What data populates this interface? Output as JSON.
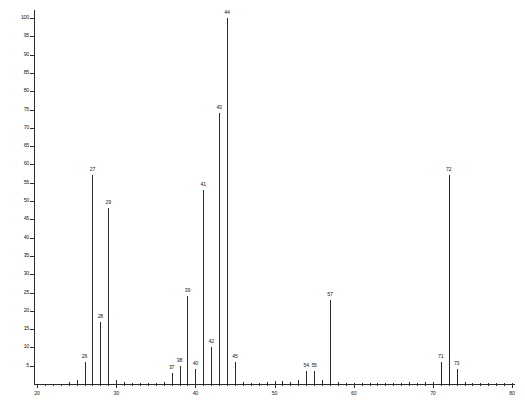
{
  "chart_data": {
    "type": "bar",
    "title": "",
    "subtitle": "",
    "xlabel": "",
    "ylabel": "",
    "xlim": [
      20,
      80
    ],
    "ylim": [
      0,
      100
    ],
    "grid": false,
    "legend": null,
    "x_ticks_major": [
      "20",
      "30",
      "40",
      "50",
      "60",
      "70",
      "80"
    ],
    "x_tick_step_minor": 1,
    "y_ticks": [
      "5",
      "10",
      "15",
      "20",
      "25",
      "30",
      "35",
      "40",
      "45",
      "50",
      "55",
      "60",
      "65",
      "70",
      "75",
      "80",
      "85",
      "90",
      "95",
      "100"
    ],
    "y_tick_step": 5,
    "categories": [
      26,
      27,
      28,
      29,
      37,
      38,
      39,
      40,
      41,
      42,
      43,
      44,
      45,
      54,
      55,
      57,
      71,
      72,
      73
    ],
    "values": [
      6,
      57,
      17,
      48,
      3,
      5,
      24,
      4,
      53,
      10,
      74,
      100,
      6,
      3.5,
      3.5,
      23,
      6,
      57,
      4
    ],
    "labeled_peaks": [
      {
        "mz": 26,
        "intensity": 6,
        "label": "26"
      },
      {
        "mz": 27,
        "intensity": 57,
        "label": "27"
      },
      {
        "mz": 28,
        "intensity": 17,
        "label": "28"
      },
      {
        "mz": 29,
        "intensity": 48,
        "label": "29"
      },
      {
        "mz": 37,
        "intensity": 3,
        "label": "37"
      },
      {
        "mz": 38,
        "intensity": 5,
        "label": "38"
      },
      {
        "mz": 39,
        "intensity": 24,
        "label": "39"
      },
      {
        "mz": 40,
        "intensity": 4,
        "label": "40"
      },
      {
        "mz": 41,
        "intensity": 53,
        "label": "41"
      },
      {
        "mz": 42,
        "intensity": 10,
        "label": "42"
      },
      {
        "mz": 43,
        "intensity": 74,
        "label": "43"
      },
      {
        "mz": 44,
        "intensity": 100,
        "label": "44"
      },
      {
        "mz": 45,
        "intensity": 6,
        "label": "45"
      },
      {
        "mz": 54,
        "intensity": 3.5,
        "label": "54"
      },
      {
        "mz": 55,
        "intensity": 3.5,
        "label": "55"
      },
      {
        "mz": 57,
        "intensity": 23,
        "label": "57"
      },
      {
        "mz": 71,
        "intensity": 6,
        "label": "71"
      },
      {
        "mz": 72,
        "intensity": 57,
        "label": "72"
      },
      {
        "mz": 73,
        "intensity": 4,
        "label": "73"
      }
    ],
    "unlabeled_peaks": [
      {
        "mz": 24,
        "intensity": 0.6
      },
      {
        "mz": 25,
        "intensity": 1.2
      },
      {
        "mz": 30,
        "intensity": 1.0
      },
      {
        "mz": 31,
        "intensity": 0.5
      },
      {
        "mz": 32,
        "intensity": 0.4
      },
      {
        "mz": 33,
        "intensity": 0.4
      },
      {
        "mz": 34,
        "intensity": 0.4
      },
      {
        "mz": 35,
        "intensity": 0.4
      },
      {
        "mz": 36,
        "intensity": 0.5
      },
      {
        "mz": 46,
        "intensity": 0.5
      },
      {
        "mz": 47,
        "intensity": 0.4
      },
      {
        "mz": 48,
        "intensity": 0.4
      },
      {
        "mz": 49,
        "intensity": 0.5
      },
      {
        "mz": 50,
        "intensity": 0.9
      },
      {
        "mz": 51,
        "intensity": 0.9
      },
      {
        "mz": 52,
        "intensity": 0.6
      },
      {
        "mz": 53,
        "intensity": 1.0
      },
      {
        "mz": 56,
        "intensity": 1.0
      },
      {
        "mz": 58,
        "intensity": 0.5
      },
      {
        "mz": 59,
        "intensity": 0.4
      },
      {
        "mz": 60,
        "intensity": 0.4
      },
      {
        "mz": 61,
        "intensity": 0.4
      },
      {
        "mz": 62,
        "intensity": 0.4
      },
      {
        "mz": 63,
        "intensity": 0.4
      },
      {
        "mz": 64,
        "intensity": 0.4
      },
      {
        "mz": 65,
        "intensity": 0.4
      },
      {
        "mz": 66,
        "intensity": 0.4
      },
      {
        "mz": 67,
        "intensity": 0.5
      },
      {
        "mz": 68,
        "intensity": 0.4
      },
      {
        "mz": 69,
        "intensity": 0.5
      },
      {
        "mz": 70,
        "intensity": 0.6
      },
      {
        "mz": 74,
        "intensity": 0.5
      },
      {
        "mz": 75,
        "intensity": 0.4
      },
      {
        "mz": 76,
        "intensity": 0.4
      },
      {
        "mz": 77,
        "intensity": 0.4
      },
      {
        "mz": 78,
        "intensity": 0.4
      },
      {
        "mz": 79,
        "intensity": 0.4
      },
      {
        "mz": 80,
        "intensity": 0.4
      }
    ]
  },
  "colors": {
    "ink": "#2b2b2b",
    "background": "#ffffff"
  }
}
